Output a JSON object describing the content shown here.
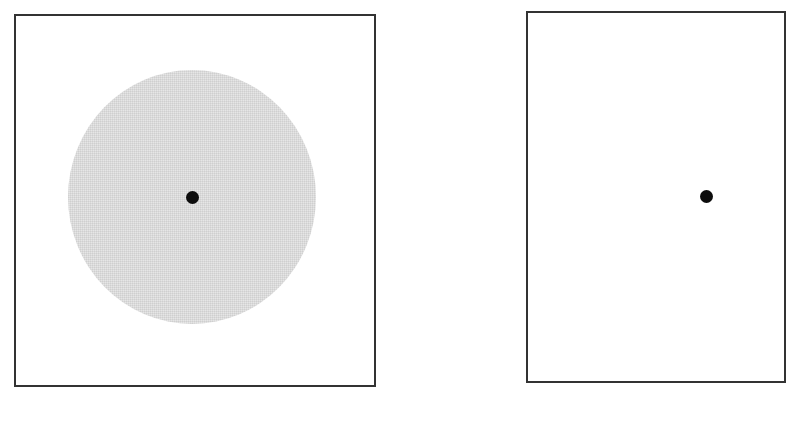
{
  "figure": {
    "panels": [
      {
        "id": "left",
        "has_shaded_disc": true,
        "disc_color": "#e6e6e6",
        "dot_color": "#0d0d0d"
      },
      {
        "id": "right",
        "has_shaded_disc": false,
        "dot_color": "#0d0d0d"
      }
    ],
    "frame_color": "#333333"
  }
}
